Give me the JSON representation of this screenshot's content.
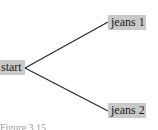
{
  "diagram": {
    "type": "tree",
    "colors": {
      "node_fill": "#c9c9c9",
      "edge": "#2a2a2a",
      "text": "#1a1a1a"
    },
    "root": {
      "id": "start",
      "label": "start"
    },
    "children": [
      {
        "id": "jeans1",
        "label": "jeans 1"
      },
      {
        "id": "jeans2",
        "label": "jeans 2"
      }
    ],
    "edges": [
      {
        "from": "start",
        "to": "jeans1"
      },
      {
        "from": "start",
        "to": "jeans2"
      }
    ],
    "caption": "Figure 3.15"
  }
}
